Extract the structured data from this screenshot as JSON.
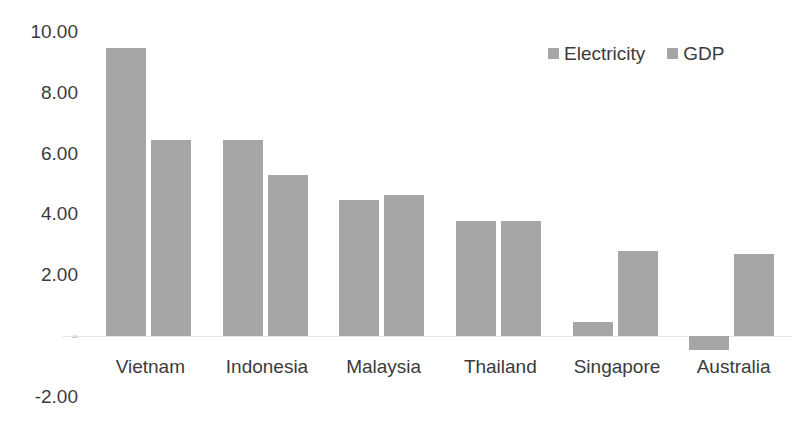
{
  "chart_data": {
    "type": "bar",
    "title": "",
    "subtitle": "",
    "xlabel": "",
    "ylabel": "",
    "categories": [
      "Vietnam",
      "Indonesia",
      "Malaysia",
      "Thailand",
      "Singapore",
      "Australia"
    ],
    "series": [
      {
        "name": "Electricity",
        "values": [
          9.47,
          6.45,
          4.47,
          3.78,
          0.45,
          -0.45
        ]
      },
      {
        "name": "GDP",
        "values": [
          6.45,
          5.3,
          4.64,
          3.78,
          2.8,
          2.7
        ]
      }
    ],
    "ylim": [
      -2.0,
      10.0
    ],
    "ytick_values": [
      10.0,
      8.0,
      6.0,
      4.0,
      2.0,
      0.0,
      -2.0
    ],
    "ytick_labels": [
      "10.00",
      "8.00",
      "6.00",
      "4.00",
      "2.00",
      "-",
      "-2.00"
    ],
    "grid": false,
    "legend_position": "top-right",
    "legend": [
      "Electricity",
      "GDP"
    ],
    "series_colors": [
      "#a6a6a6",
      "#a6a6a6"
    ],
    "zero_line_color": "#e4e4e4",
    "text_color": "#3b3b3b",
    "background": "#ffffff"
  }
}
